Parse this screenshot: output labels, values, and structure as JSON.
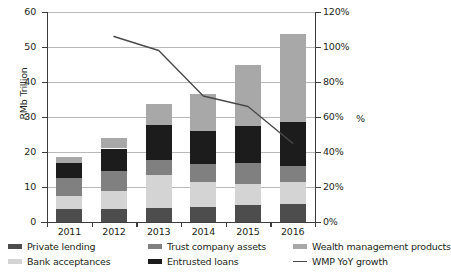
{
  "chart_data": {
    "type": "bar",
    "subtype": "stacked-bar-with-line",
    "title": "",
    "xlabel": "",
    "ylabel": "RMb Trillion",
    "y2label": "%",
    "categories": [
      "2011",
      "2012",
      "2013",
      "2014",
      "2015",
      "2016"
    ],
    "ylim": [
      0,
      60
    ],
    "yticks": [
      "0",
      "10",
      "20",
      "30",
      "40",
      "50",
      "60"
    ],
    "ytick_values": [
      0,
      10,
      20,
      30,
      40,
      50,
      60
    ],
    "y2lim": [
      0,
      120
    ],
    "y2ticks": [
      "0%",
      "20%",
      "40%",
      "60%",
      "80%",
      "100%",
      "120%"
    ],
    "y2tick_values": [
      0,
      20,
      40,
      60,
      80,
      100,
      120
    ],
    "grid": true,
    "legend_position": "bottom",
    "series": [
      {
        "name": "Private lending",
        "axis": "left",
        "type": "bar",
        "color": "#4d4d4d",
        "values": [
          3.6,
          3.7,
          4.0,
          4.2,
          4.9,
          5.1
        ]
      },
      {
        "name": "Bank acceptances",
        "axis": "left",
        "type": "bar",
        "color": "#d4d4d4",
        "values": [
          3.7,
          5.2,
          9.3,
          7.3,
          5.9,
          6.3
        ]
      },
      {
        "name": "Trust company assets",
        "axis": "left",
        "type": "bar",
        "color": "#808080",
        "values": [
          5.2,
          5.7,
          4.5,
          5.2,
          6.0,
          4.7
        ]
      },
      {
        "name": "Entrusted loans",
        "axis": "left",
        "type": "bar",
        "color": "#1c1c1c",
        "values": [
          4.4,
          6.4,
          9.9,
          9.4,
          10.7,
          12.4
        ]
      },
      {
        "name": "Wealth management products",
        "axis": "left",
        "type": "bar",
        "color": "#a8a8a8",
        "values": [
          1.7,
          3.1,
          6.0,
          10.4,
          17.5,
          25.3
        ]
      },
      {
        "name": "WMP YoY growth",
        "axis": "right",
        "type": "line",
        "color": "#4a4a4a",
        "x": [
          "2012",
          "2013",
          "2014",
          "2015",
          "2016"
        ],
        "values": [
          106,
          98,
          72,
          66,
          45
        ]
      }
    ],
    "stack_totals": [
      18.6,
      24.1,
      33.7,
      36.5,
      45.0,
      53.8
    ]
  },
  "legend": {
    "items": [
      {
        "label": "Private lending",
        "marker": "bar-swatch",
        "color": "#4d4d4d"
      },
      {
        "label": "Bank acceptances",
        "marker": "bar-swatch",
        "color": "#d4d4d4"
      },
      {
        "label": "Trust company assets",
        "marker": "bar-swatch",
        "color": "#808080"
      },
      {
        "label": "Entrusted loans",
        "marker": "bar-swatch",
        "color": "#1c1c1c"
      },
      {
        "label": "Wealth management products",
        "marker": "bar-swatch",
        "color": "#a8a8a8"
      },
      {
        "label": "WMP YoY growth",
        "marker": "line-swatch",
        "color": "#4a4a4a"
      }
    ]
  }
}
